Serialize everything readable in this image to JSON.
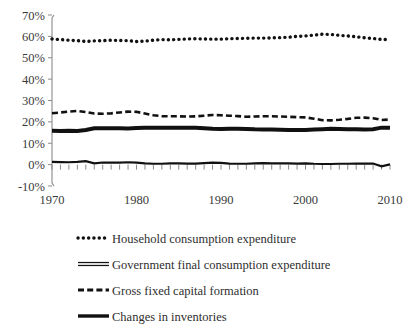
{
  "chart_data": {
    "type": "line",
    "title": "",
    "subtitle": "",
    "xlabel": "",
    "ylabel": "",
    "xlim": [
      1970,
      2010
    ],
    "ylim": [
      -10,
      70
    ],
    "ytick_step": 10,
    "ytick_labels": [
      "70%",
      "60%",
      "50%",
      "40%",
      "30%",
      "20%",
      "10%",
      "0%",
      "-10%"
    ],
    "ytick_values": [
      70,
      60,
      50,
      40,
      30,
      20,
      10,
      0,
      -10
    ],
    "xtick_labels": [
      "1970",
      "1980",
      "1990",
      "2000",
      "2010"
    ],
    "xtick_values": [
      1970,
      1980,
      1990,
      2000,
      2010
    ],
    "minor_xticks": true,
    "grid": false,
    "legend_position": "below",
    "x": [
      1970,
      1971,
      1972,
      1973,
      1974,
      1975,
      1976,
      1977,
      1978,
      1979,
      1980,
      1981,
      1982,
      1983,
      1984,
      1985,
      1986,
      1987,
      1988,
      1989,
      1990,
      1991,
      1992,
      1993,
      1994,
      1995,
      1996,
      1997,
      1998,
      1999,
      2000,
      2001,
      2002,
      2003,
      2004,
      2005,
      2006,
      2007,
      2008,
      2009,
      2010
    ],
    "series": [
      {
        "name": "Household consumption expenditure",
        "style": "dotted",
        "color": "#111111",
        "values": [
          58.8,
          58.5,
          58.2,
          58.0,
          57.6,
          57.9,
          58.0,
          58.2,
          58.1,
          58.0,
          57.6,
          57.8,
          58.2,
          58.5,
          58.4,
          58.6,
          58.8,
          58.9,
          58.8,
          58.7,
          58.7,
          58.9,
          59.0,
          59.1,
          59.2,
          59.2,
          59.3,
          59.4,
          59.6,
          60.0,
          60.2,
          60.6,
          61.0,
          60.9,
          60.5,
          60.2,
          59.8,
          59.3,
          59.0,
          58.6,
          58.5
        ]
      },
      {
        "name": "Government final consumption expenditure",
        "style": "double",
        "color": "#111111",
        "values": [
          15.8,
          15.7,
          15.8,
          15.7,
          16.2,
          17.0,
          17.0,
          17.0,
          17.0,
          16.9,
          17.1,
          17.2,
          17.3,
          17.2,
          17.2,
          17.3,
          17.3,
          17.2,
          17.0,
          16.8,
          16.7,
          16.8,
          16.8,
          16.7,
          16.5,
          16.4,
          16.4,
          16.3,
          16.2,
          16.2,
          16.2,
          16.4,
          16.6,
          16.8,
          16.7,
          16.6,
          16.5,
          16.4,
          16.6,
          17.3,
          17.2
        ]
      },
      {
        "name": "Gross fixed capital formation",
        "style": "dashed",
        "color": "#111111",
        "values": [
          24.0,
          24.4,
          24.8,
          25.1,
          24.6,
          23.9,
          23.8,
          24.0,
          24.4,
          24.8,
          24.7,
          23.9,
          23.1,
          22.7,
          22.6,
          22.6,
          22.5,
          22.6,
          22.9,
          23.2,
          23.1,
          22.9,
          22.7,
          22.4,
          22.5,
          22.6,
          22.6,
          22.5,
          22.4,
          22.2,
          22.1,
          21.5,
          20.8,
          20.7,
          21.0,
          21.4,
          21.9,
          22.0,
          21.7,
          20.9,
          21.1
        ]
      },
      {
        "name": "Changes in inventories",
        "style": "solid",
        "color": "#111111",
        "values": [
          1.3,
          1.2,
          1.1,
          1.3,
          1.6,
          0.6,
          1.0,
          0.9,
          0.9,
          1.1,
          0.9,
          0.6,
          0.4,
          0.4,
          0.6,
          0.6,
          0.5,
          0.5,
          0.7,
          0.9,
          0.8,
          0.5,
          0.4,
          0.4,
          0.6,
          0.7,
          0.6,
          0.6,
          0.6,
          0.5,
          0.6,
          0.4,
          0.3,
          0.3,
          0.4,
          0.4,
          0.5,
          0.5,
          0.5,
          -0.8,
          0.1
        ]
      }
    ],
    "legend": [
      {
        "label": "Household consumption expenditure",
        "style": "dotted"
      },
      {
        "label": "Government final consumption expenditure",
        "style": "double"
      },
      {
        "label": "Gross fixed capital formation",
        "style": "dashed"
      },
      {
        "label": "Changes in inventories",
        "style": "solid"
      }
    ]
  }
}
